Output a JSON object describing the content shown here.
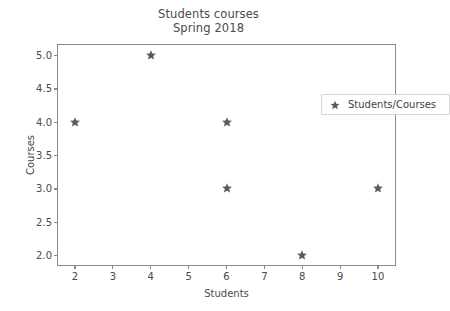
{
  "chart_data": {
    "type": "scatter",
    "title": "Students courses",
    "subtitle": "Spring 2018",
    "xlabel": "Students",
    "ylabel": "Courses",
    "xlim": [
      1.55,
      10.45
    ],
    "ylim": [
      1.85,
      5.15
    ],
    "grid": false,
    "legend_position": "upper right",
    "marker": "star",
    "marker_color": "#5a5a5a",
    "xticks": [
      "2",
      "3",
      "4",
      "5",
      "6",
      "7",
      "8",
      "9",
      "10"
    ],
    "xtick_values": [
      2,
      3,
      4,
      5,
      6,
      7,
      8,
      9,
      10
    ],
    "yticks": [
      "2.0",
      "2.5",
      "3.0",
      "3.5",
      "4.0",
      "4.5",
      "5.0"
    ],
    "ytick_values": [
      2.0,
      2.5,
      3.0,
      3.5,
      4.0,
      4.5,
      5.0
    ],
    "series": [
      {
        "name": "Students/Courses",
        "x": [
          2,
          4,
          6,
          6,
          8,
          10
        ],
        "y": [
          4.0,
          5.0,
          4.0,
          3.0,
          2.0,
          3.0
        ],
        "points": [
          {
            "x": 2,
            "y": 4.0
          },
          {
            "x": 4,
            "y": 5.0
          },
          {
            "x": 6,
            "y": 4.0
          },
          {
            "x": 6,
            "y": 3.0
          },
          {
            "x": 8,
            "y": 2.0
          },
          {
            "x": 10,
            "y": 3.0
          }
        ]
      }
    ]
  },
  "legend": {
    "label": "Students/Courses"
  },
  "colors": {
    "marker": "#5a5a5a",
    "axis": "#8a8a8a",
    "text": "#4a4a4a",
    "background": "#ffffff"
  }
}
